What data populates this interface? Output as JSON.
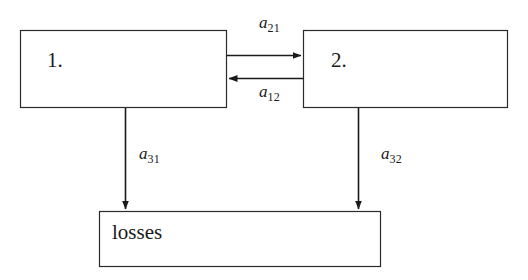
{
  "diagram": {
    "type": "block-flow-diagram",
    "background_color": "#ffffff",
    "line_color": "#1a1a1a",
    "nodes": [
      {
        "id": "node-1",
        "label": "1.",
        "x": 20,
        "y": 30,
        "width": 207,
        "height": 78
      },
      {
        "id": "node-2",
        "label": "2.",
        "x": 303,
        "y": 30,
        "width": 205,
        "height": 78
      },
      {
        "id": "node-losses",
        "label": "losses",
        "x": 99,
        "y": 211,
        "width": 282,
        "height": 56
      }
    ],
    "edges": [
      {
        "id": "edge-a21",
        "from": "node-1",
        "to": "node-2",
        "symbol": "a",
        "subscript": "21",
        "label": "a21",
        "direction": "right"
      },
      {
        "id": "edge-a12",
        "from": "node-2",
        "to": "node-1",
        "symbol": "a",
        "subscript": "12",
        "label": "a12",
        "direction": "left"
      },
      {
        "id": "edge-a31",
        "from": "node-1",
        "to": "node-losses",
        "symbol": "a",
        "subscript": "31",
        "label": "a31",
        "direction": "down"
      },
      {
        "id": "edge-a32",
        "from": "node-2",
        "to": "node-losses",
        "symbol": "a",
        "subscript": "32",
        "label": "a32",
        "direction": "down"
      }
    ]
  }
}
